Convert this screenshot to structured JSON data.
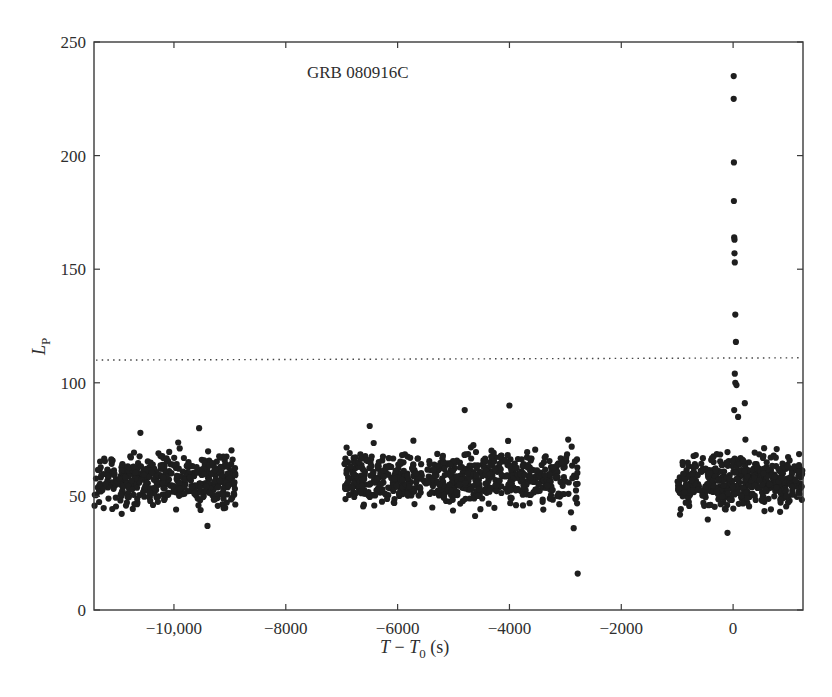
{
  "chart_data": {
    "type": "scatter",
    "title": "",
    "annotation": "GRB 080916C",
    "xlabel": "T − T0 (s)",
    "xlabel_parts": {
      "T": "T",
      "minus": " − ",
      "T0": "T",
      "sub": "0",
      "unit": " (s)"
    },
    "ylabel": "L_P",
    "ylabel_parts": {
      "L": "L",
      "sub": "P"
    },
    "xlim": [
      -11430,
      1250
    ],
    "ylim": [
      0,
      250
    ],
    "x_ticks": [
      -10000,
      -8000,
      -6000,
      -4000,
      -2000,
      0
    ],
    "x_tick_labels": [
      "−10,000",
      "−8000",
      "−6000",
      "−4000",
      "−2000",
      "0"
    ],
    "y_ticks": [
      0,
      50,
      100,
      150,
      200,
      250
    ],
    "y_tick_labels": [
      "0",
      "50",
      "100",
      "150",
      "200",
      "250"
    ],
    "grid": false,
    "legend": null,
    "threshold_line": {
      "y": 110,
      "y_end": 111,
      "style": "dotted",
      "label": ""
    },
    "marker_color": "#1e1e1e",
    "background_segments": [
      {
        "x_start": -11430,
        "x_end": -8900,
        "mean": 57,
        "spread": 8,
        "count": 480,
        "seed": 11
      },
      {
        "x_start": -6950,
        "x_end": -2780,
        "mean": 58,
        "spread": 8,
        "count": 700,
        "seed": 23
      },
      {
        "x_start": -1000,
        "x_end": 1250,
        "mean": 57,
        "spread": 8,
        "count": 460,
        "seed": 37
      }
    ],
    "outliers": [
      {
        "x": -9550,
        "y": 80
      },
      {
        "x": -10600,
        "y": 78
      },
      {
        "x": -9400,
        "y": 37
      },
      {
        "x": -6500,
        "y": 81
      },
      {
        "x": -4800,
        "y": 88
      },
      {
        "x": -4000,
        "y": 90
      },
      {
        "x": -2900,
        "y": 43
      },
      {
        "x": -2850,
        "y": 36
      },
      {
        "x": -2780,
        "y": 16
      },
      {
        "x": -2950,
        "y": 75
      },
      {
        "x": -100,
        "y": 34
      },
      {
        "x": -950,
        "y": 42
      }
    ],
    "burst_points": [
      {
        "x": 10,
        "y": 235
      },
      {
        "x": 10,
        "y": 225
      },
      {
        "x": 15,
        "y": 197
      },
      {
        "x": 15,
        "y": 180
      },
      {
        "x": 20,
        "y": 164
      },
      {
        "x": 25,
        "y": 163
      },
      {
        "x": 25,
        "y": 157
      },
      {
        "x": 30,
        "y": 153
      },
      {
        "x": 40,
        "y": 130
      },
      {
        "x": 50,
        "y": 118
      },
      {
        "x": 30,
        "y": 104
      },
      {
        "x": 40,
        "y": 100
      },
      {
        "x": 60,
        "y": 99
      },
      {
        "x": 210,
        "y": 91
      },
      {
        "x": 20,
        "y": 88
      },
      {
        "x": 90,
        "y": 85
      },
      {
        "x": 220,
        "y": 75
      }
    ]
  }
}
